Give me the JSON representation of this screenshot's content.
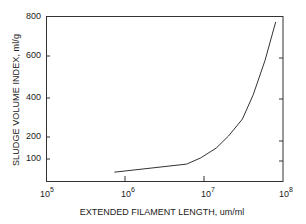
{
  "chart_data": {
    "type": "line",
    "title": "",
    "xlabel": "EXTENDED FILAMENT LENGTH, um/ml",
    "ylabel": "SLUDGE VOLUME INDEX, ml/g",
    "xscale": "log",
    "xlim": [
      100000,
      100000000
    ],
    "ylim": [
      0,
      800
    ],
    "x_ticks": [
      {
        "base": "10",
        "exp": "5",
        "value": 100000
      },
      {
        "base": "10",
        "exp": "6",
        "value": 1000000
      },
      {
        "base": "10",
        "exp": "7",
        "value": 10000000
      },
      {
        "base": "10",
        "exp": "8",
        "value": 100000000
      }
    ],
    "y_ticks": [
      100,
      200,
      400,
      600,
      800
    ],
    "grid": false,
    "legend": null,
    "series": [
      {
        "name": "SVI vs extended filament length",
        "x": [
          720000,
          5900000,
          8900000,
          14000000,
          20000000,
          30000000,
          41000000,
          58000000,
          79000000
        ],
        "y": [
          40,
          77,
          105,
          150,
          205,
          292,
          415,
          580,
          775
        ]
      }
    ]
  },
  "labels": {
    "ylabel": "SLUDGE VOLUME INDEX, ml/g",
    "xlabel": "EXTENDED FILAMENT LENGTH, um/ml",
    "y_ticks": [
      "800",
      "600",
      "400",
      "200",
      "100"
    ],
    "x_ticks": [
      {
        "base": "10",
        "exp": "5"
      },
      {
        "base": "10",
        "exp": "6"
      },
      {
        "base": "10",
        "exp": "7"
      },
      {
        "base": "10",
        "exp": "8"
      }
    ]
  },
  "colors": {
    "axis": "#333333",
    "line": "#333333",
    "background": "#ffffff"
  }
}
